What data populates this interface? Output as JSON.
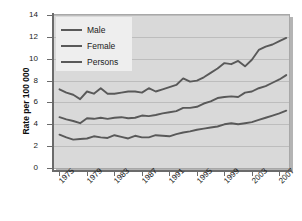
{
  "chart_data": {
    "type": "line",
    "title": "",
    "xlabel": "",
    "ylabel": "Rate per 100 000",
    "xlim": [
      1974.2,
      2008.4
    ],
    "ylim": [
      0,
      14
    ],
    "grid": true,
    "legend_position": "top-left",
    "y_ticks": [
      0,
      2,
      4,
      6,
      8,
      10,
      12,
      14
    ],
    "y_tick_labels": [
      "0",
      "2",
      "4",
      "6",
      "8",
      "10",
      "12",
      "14"
    ],
    "x_ticks": [
      1975,
      1979,
      1983,
      1987,
      1991,
      1995,
      1999,
      2003,
      2007
    ],
    "x_tick_labels": [
      "1975",
      "1979",
      "1983",
      "1987",
      "1991",
      "1995",
      "1999",
      "2003",
      "2007"
    ],
    "x": [
      1975,
      1976,
      1977,
      1978,
      1979,
      1980,
      1981,
      1982,
      1983,
      1984,
      1985,
      1986,
      1987,
      1988,
      1989,
      1990,
      1991,
      1992,
      1993,
      1994,
      1995,
      1996,
      1997,
      1998,
      1999,
      2000,
      2001,
      2002,
      2003,
      2004,
      2005,
      2006,
      2007,
      2008
    ],
    "series": [
      {
        "name": "Male",
        "color": "#595959",
        "values": [
          7.2,
          6.9,
          6.7,
          6.3,
          7.0,
          6.8,
          7.3,
          6.8,
          6.8,
          6.9,
          7.0,
          7.0,
          6.9,
          7.3,
          7.0,
          7.2,
          7.4,
          7.6,
          8.2,
          7.9,
          8.0,
          8.3,
          8.7,
          9.1,
          9.6,
          9.5,
          9.8,
          9.3,
          9.9,
          10.8,
          11.1,
          11.3,
          11.6,
          11.9
        ]
      },
      {
        "name": "Female",
        "color": "#595959",
        "values": [
          3.05,
          2.8,
          2.6,
          2.65,
          2.7,
          2.9,
          2.8,
          2.75,
          3.0,
          2.85,
          2.7,
          2.95,
          2.8,
          2.8,
          3.0,
          2.95,
          2.9,
          3.1,
          3.25,
          3.35,
          3.5,
          3.6,
          3.7,
          3.8,
          4.0,
          4.1,
          4.0,
          4.1,
          4.2,
          4.4,
          4.6,
          4.8,
          5.0,
          5.25
        ]
      },
      {
        "name": "Persons",
        "color": "#595959",
        "values": [
          4.65,
          4.45,
          4.3,
          4.1,
          4.55,
          4.5,
          4.6,
          4.5,
          4.6,
          4.65,
          4.55,
          4.6,
          4.8,
          4.75,
          4.85,
          5.0,
          5.1,
          5.2,
          5.5,
          5.5,
          5.6,
          5.9,
          6.1,
          6.4,
          6.5,
          6.55,
          6.5,
          6.9,
          7.0,
          7.3,
          7.5,
          7.8,
          8.1,
          8.5
        ]
      }
    ]
  },
  "legend": {
    "items": [
      {
        "label": "Male"
      },
      {
        "label": "Female"
      },
      {
        "label": "Persons"
      }
    ]
  },
  "colors": {
    "plot_background": "#d9d9d9",
    "gridline": "#bdbdbd",
    "axis": "#6b6b6b",
    "series_line": "#595959",
    "legend_background": "#eeeeee",
    "text": "#1a1a1a"
  }
}
